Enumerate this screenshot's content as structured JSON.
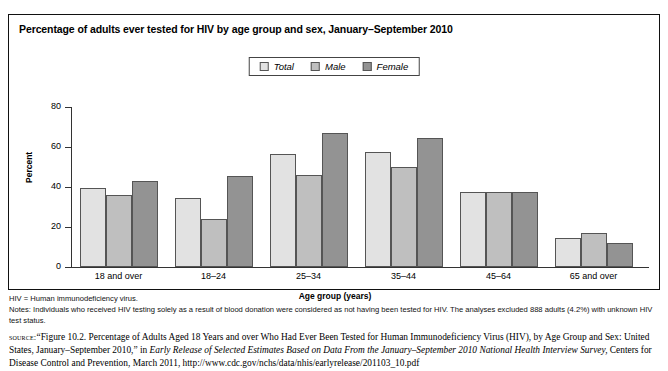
{
  "chart_data": {
    "type": "bar",
    "title": "Percentage of adults ever tested for HIV by age group and sex, January–September 2010",
    "xlabel": "Age group (years)",
    "ylabel": "Percent",
    "ylim": [
      0,
      80
    ],
    "yticks": [
      0,
      20,
      40,
      60,
      80
    ],
    "grid": false,
    "legend_position": "top-center",
    "categories": [
      "18 and over",
      "18–24",
      "25–34",
      "35–44",
      "45–64",
      "65 and over"
    ],
    "series": [
      {
        "name": "Total",
        "color": "#e2e2e2",
        "values": [
          39.5,
          34.5,
          56.5,
          57.5,
          37.5,
          14.5
        ]
      },
      {
        "name": "Male",
        "color": "#bfbfbf",
        "values": [
          36.0,
          24.0,
          46.0,
          50.0,
          37.5,
          17.0
        ]
      },
      {
        "name": "Female",
        "color": "#939393",
        "values": [
          43.0,
          45.5,
          67.0,
          64.5,
          37.5,
          12.0
        ]
      }
    ]
  },
  "notes": {
    "abbrev": "HIV = Human immunodeficiency virus.",
    "note_line": "Notes: Individuals who received HIV testing solely as a result of blood donation were considered as not having been tested for HIV. The analyses excluded 888 adults (4.2%) with unknown HIV test status."
  },
  "source": {
    "label": "source:",
    "part1": "“Figure 10.2. Percentage of Adults Aged 18 Years and over Who Had Ever Been Tested for Human Immunodeficiency Virus (HIV), by Age Group and Sex: United States, January–September 2010,” in ",
    "italic1": "Early Release of Selected Estimates Based on Data From the January–September 2010 National Health Interview Survey,",
    "part2": " Centers for Disease Control and Prevention, March 2011, http://www.cdc.gov/nchs/data/nhis/earlyrelease/201103_10.pdf"
  }
}
